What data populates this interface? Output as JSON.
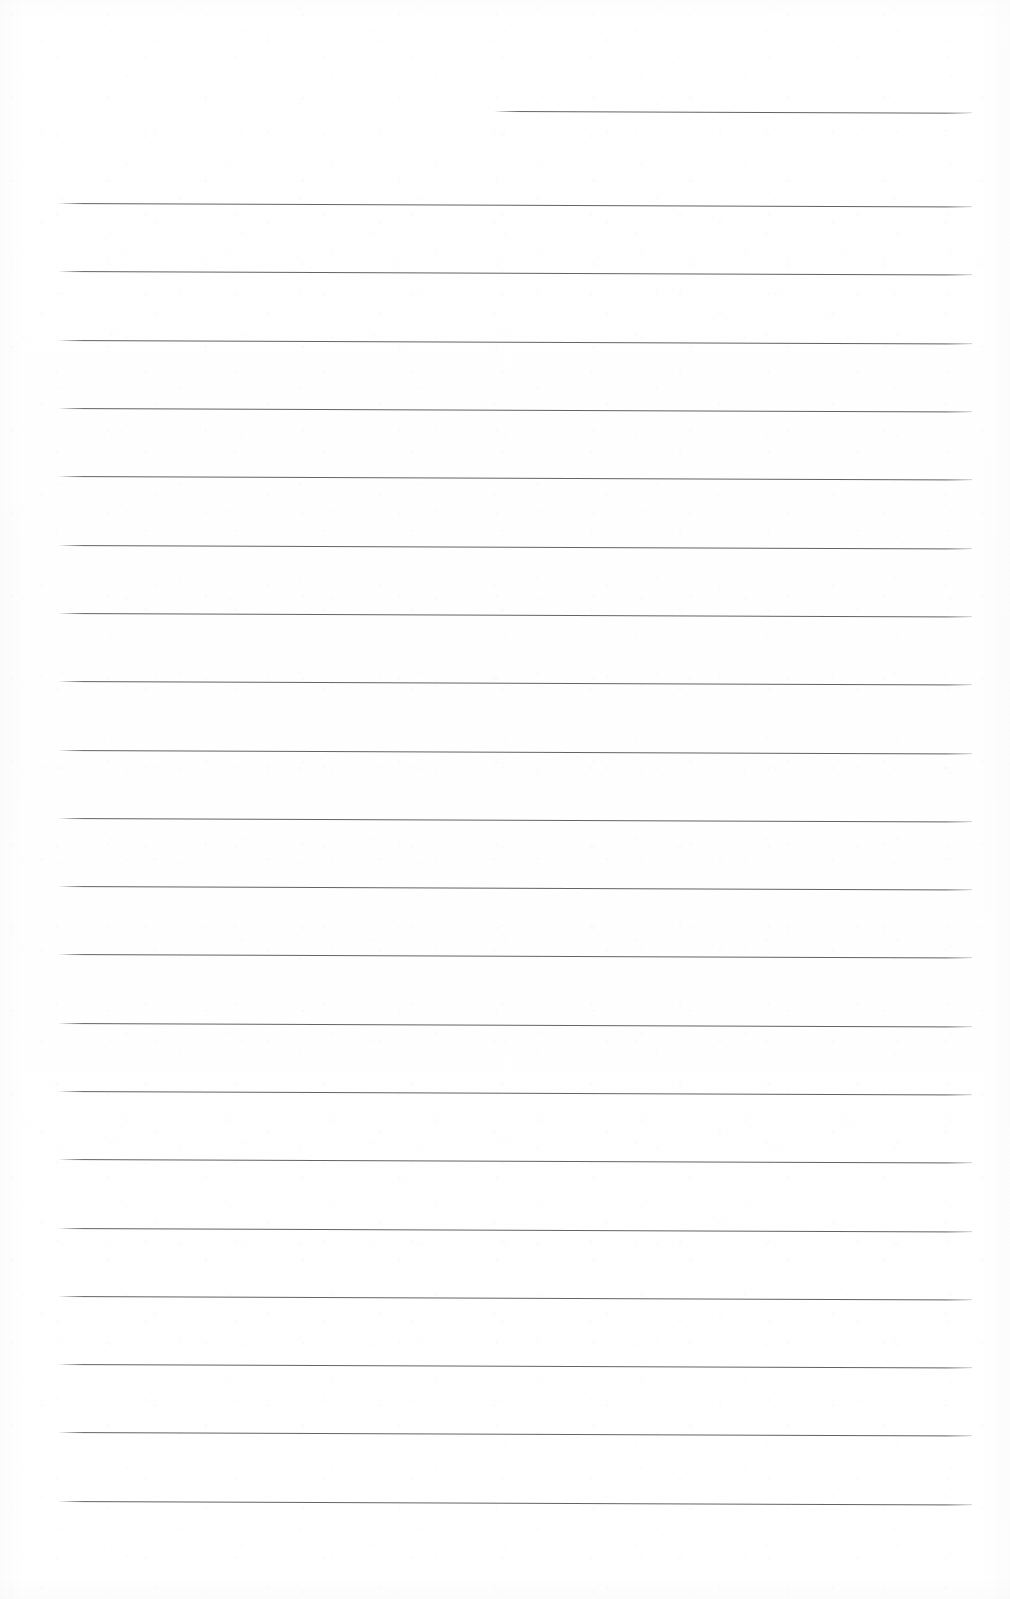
{
  "document": {
    "kind": "scanned-lined-answer-sheet",
    "orientation": "portrait",
    "page_width_px": 1010,
    "page_height_px": 1599,
    "paper_color": "#ffffff",
    "rule_color": "#4e4e4e",
    "rule_thickness_px": 1.6,
    "rule_opacity": 0.88,
    "slant_degrees": 0.22,
    "left_margin_px": 58,
    "right_edge_px": 972,
    "line_spacing_px": 68.3,
    "total_rules": 21,
    "full_width_rules": 20,
    "short_rules": 1,
    "visible_text": "",
    "handwriting_present": "no",
    "header_text": "",
    "footer_text": "",
    "page_number": ""
  },
  "rules": [
    {
      "id": 0,
      "label": "short-header-rule",
      "x": 494,
      "y": 111,
      "width": 478,
      "short": true
    },
    {
      "id": 1,
      "label": "rule-1",
      "x": 58,
      "y": 203,
      "width": 914,
      "short": false
    },
    {
      "id": 2,
      "label": "rule-2",
      "x": 58,
      "y": 271,
      "width": 914,
      "short": false
    },
    {
      "id": 3,
      "label": "rule-3",
      "x": 58,
      "y": 340,
      "width": 914,
      "short": false
    },
    {
      "id": 4,
      "label": "rule-4",
      "x": 58,
      "y": 408,
      "width": 914,
      "short": false
    },
    {
      "id": 5,
      "label": "rule-5",
      "x": 58,
      "y": 476,
      "width": 914,
      "short": false
    },
    {
      "id": 6,
      "label": "rule-6",
      "x": 58,
      "y": 545,
      "width": 914,
      "short": false
    },
    {
      "id": 7,
      "label": "rule-7",
      "x": 58,
      "y": 613,
      "width": 914,
      "short": false
    },
    {
      "id": 8,
      "label": "rule-8",
      "x": 58,
      "y": 681,
      "width": 914,
      "short": false
    },
    {
      "id": 9,
      "label": "rule-9",
      "x": 58,
      "y": 750,
      "width": 914,
      "short": false
    },
    {
      "id": 10,
      "label": "rule-10",
      "x": 58,
      "y": 818,
      "width": 914,
      "short": false
    },
    {
      "id": 11,
      "label": "rule-11",
      "x": 58,
      "y": 886,
      "width": 914,
      "short": false
    },
    {
      "id": 12,
      "label": "rule-12",
      "x": 58,
      "y": 954,
      "width": 914,
      "short": false
    },
    {
      "id": 13,
      "label": "rule-13",
      "x": 58,
      "y": 1023,
      "width": 914,
      "short": false
    },
    {
      "id": 14,
      "label": "rule-14",
      "x": 58,
      "y": 1091,
      "width": 914,
      "short": false
    },
    {
      "id": 15,
      "label": "rule-15",
      "x": 58,
      "y": 1159,
      "width": 914,
      "short": false
    },
    {
      "id": 16,
      "label": "rule-16",
      "x": 58,
      "y": 1228,
      "width": 914,
      "short": false
    },
    {
      "id": 17,
      "label": "rule-17",
      "x": 58,
      "y": 1296,
      "width": 914,
      "short": false
    },
    {
      "id": 18,
      "label": "rule-18",
      "x": 58,
      "y": 1364,
      "width": 914,
      "short": false
    },
    {
      "id": 19,
      "label": "rule-19",
      "x": 58,
      "y": 1432,
      "width": 914,
      "short": false
    },
    {
      "id": 20,
      "label": "rule-20",
      "x": 58,
      "y": 1501,
      "width": 914,
      "short": false
    }
  ]
}
